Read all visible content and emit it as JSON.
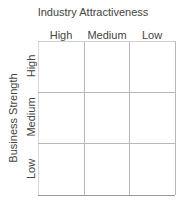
{
  "diagram": {
    "type": "matrix",
    "title": "Industry Attractiveness",
    "x_axis_label": "Industry Attractiveness",
    "y_axis_label": "Business Strength",
    "columns": [
      "High",
      "Medium",
      "Low"
    ],
    "rows": [
      "High",
      "Medium",
      "Low"
    ],
    "cells": [
      [
        "",
        "",
        ""
      ],
      [
        "",
        "",
        ""
      ],
      [
        "",
        "",
        ""
      ]
    ],
    "line_color": "#b8b8b8",
    "text_color": "#444444"
  }
}
